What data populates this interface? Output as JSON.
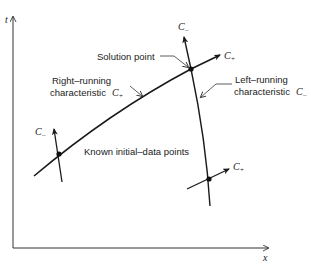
{
  "figure": {
    "axes": {
      "y_label": "t",
      "x_label": "x"
    },
    "labels": {
      "solution_point": "Solution point",
      "right_running_line1": "Right–running",
      "right_running_line2": "characteristic",
      "right_running_symbol": "C",
      "right_running_sub": "+",
      "left_running_line1": "Left–running",
      "left_running_line2": "characteristic",
      "left_running_symbol": "C",
      "left_running_sub": "–",
      "known_points": "Known initial–data points",
      "c_minus_top": "C",
      "c_minus_top_sub": "–",
      "c_plus_top": "C",
      "c_plus_top_sub": "+",
      "c_minus_left": "C",
      "c_minus_left_sub": "–",
      "c_plus_right": "C",
      "c_plus_right_sub": "+"
    },
    "points": [
      {
        "name": "solution-point",
        "x": 191,
        "y": 69
      },
      {
        "name": "known-point-left",
        "x": 59,
        "y": 154
      },
      {
        "name": "known-point-right",
        "x": 209,
        "y": 179
      }
    ],
    "colors": {
      "ink": "#1a1a1a",
      "background": "#ffffff"
    }
  }
}
